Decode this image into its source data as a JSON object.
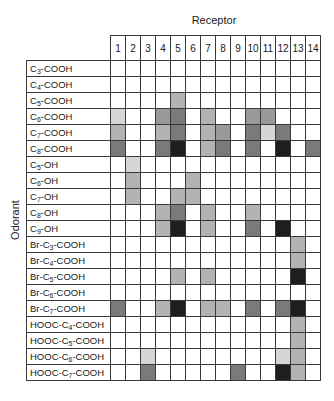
{
  "chart_data": {
    "type": "heatmap",
    "title": "Receptor",
    "xlabel": "Receptor",
    "ylabel": "Odorant",
    "legend": "none",
    "scale_note": "grayscale intensity levels 0 (white, no response) to 5 (black, strongest response)",
    "intensity_colors": [
      "#ffffff",
      "#d6d6d6",
      "#b3b3b3",
      "#999999",
      "#7a7a7a",
      "#1e1e1e"
    ],
    "columns": [
      "1",
      "2",
      "3",
      "4",
      "5",
      "6",
      "7",
      "8",
      "9",
      "10",
      "11",
      "12",
      "13",
      "14"
    ],
    "rows": [
      {
        "label": "C3-COOH",
        "prefix": "C",
        "sub": "3",
        "suffix": "-COOH"
      },
      {
        "label": "C4-COOH",
        "prefix": "C",
        "sub": "4",
        "suffix": "-COOH"
      },
      {
        "label": "C5-COOH",
        "prefix": "C",
        "sub": "5",
        "suffix": "-COOH"
      },
      {
        "label": "C6-COOH",
        "prefix": "C",
        "sub": "6",
        "suffix": "-COOH"
      },
      {
        "label": "C7-COOH",
        "prefix": "C",
        "sub": "7",
        "suffix": "-COOH"
      },
      {
        "label": "C8-COOH",
        "prefix": "C",
        "sub": "8",
        "suffix": "-COOH"
      },
      {
        "label": "C5-OH",
        "prefix": "C",
        "sub": "5",
        "suffix": "-OH"
      },
      {
        "label": "C6-OH",
        "prefix": "C",
        "sub": "6",
        "suffix": "-OH"
      },
      {
        "label": "C7-OH",
        "prefix": "C",
        "sub": "7",
        "suffix": "-OH"
      },
      {
        "label": "C8-OH",
        "prefix": "C",
        "sub": "8",
        "suffix": "-OH"
      },
      {
        "label": "C9-OH",
        "prefix": "C",
        "sub": "9",
        "suffix": "-OH"
      },
      {
        "label": "Br-C3-COOH",
        "prefix": "Br-C",
        "sub": "3",
        "suffix": "-COOH"
      },
      {
        "label": "Br-C4-COOH",
        "prefix": "Br-C",
        "sub": "4",
        "suffix": "-COOH"
      },
      {
        "label": "Br-C5-COOH",
        "prefix": "Br-C",
        "sub": "5",
        "suffix": "-COOH"
      },
      {
        "label": "Br-C6-COOH",
        "prefix": "Br-C",
        "sub": "6",
        "suffix": "-COOH"
      },
      {
        "label": "Br-C7-COOH",
        "prefix": "Br-C",
        "sub": "7",
        "suffix": "-COOH"
      },
      {
        "label": "HOOC-C4-COOH",
        "prefix": "HOOC-C",
        "sub": "4",
        "suffix": "-COOH"
      },
      {
        "label": "HOOC-C5-COOH",
        "prefix": "HOOC-C",
        "sub": "5",
        "suffix": "-COOH"
      },
      {
        "label": "HOOC-C6-COOH",
        "prefix": "HOOC-C",
        "sub": "6",
        "suffix": "-COOH"
      },
      {
        "label": "HOOC-C7-COOH",
        "prefix": "HOOC-C",
        "sub": "7",
        "suffix": "-COOH"
      }
    ],
    "values": [
      [
        0,
        0,
        0,
        0,
        0,
        0,
        0,
        0,
        0,
        0,
        0,
        0,
        0,
        0
      ],
      [
        0,
        0,
        0,
        0,
        0,
        0,
        0,
        0,
        0,
        0,
        0,
        0,
        0,
        0
      ],
      [
        0,
        0,
        0,
        0,
        2,
        0,
        0,
        0,
        0,
        0,
        0,
        0,
        0,
        0
      ],
      [
        1,
        0,
        0,
        3,
        4,
        0,
        2,
        0,
        0,
        3,
        3,
        0,
        0,
        0
      ],
      [
        2,
        0,
        0,
        2,
        4,
        0,
        2,
        3,
        0,
        4,
        1,
        4,
        0,
        0
      ],
      [
        4,
        0,
        0,
        4,
        5,
        0,
        2,
        4,
        0,
        4,
        0,
        5,
        0,
        4
      ],
      [
        0,
        1,
        0,
        0,
        0,
        0,
        0,
        0,
        0,
        0,
        0,
        0,
        0,
        0
      ],
      [
        0,
        2,
        0,
        0,
        0,
        2,
        0,
        0,
        0,
        0,
        0,
        0,
        0,
        0
      ],
      [
        0,
        2,
        0,
        0,
        2,
        2,
        0,
        0,
        0,
        0,
        0,
        0,
        0,
        0
      ],
      [
        0,
        0,
        0,
        2,
        4,
        0,
        2,
        0,
        0,
        2,
        0,
        0,
        0,
        0
      ],
      [
        0,
        0,
        0,
        2,
        5,
        0,
        2,
        0,
        0,
        4,
        0,
        5,
        0,
        0
      ],
      [
        0,
        0,
        0,
        0,
        0,
        0,
        0,
        0,
        0,
        0,
        0,
        0,
        2,
        0
      ],
      [
        0,
        0,
        0,
        0,
        0,
        0,
        0,
        0,
        0,
        0,
        0,
        0,
        2,
        0
      ],
      [
        0,
        0,
        0,
        0,
        2,
        0,
        2,
        0,
        0,
        0,
        0,
        0,
        5,
        0
      ],
      [
        0,
        0,
        0,
        0,
        0,
        0,
        0,
        0,
        0,
        0,
        0,
        0,
        0,
        0
      ],
      [
        4,
        0,
        0,
        2,
        5,
        0,
        2,
        2,
        0,
        4,
        0,
        4,
        5,
        0
      ],
      [
        0,
        0,
        0,
        0,
        0,
        0,
        0,
        0,
        0,
        0,
        0,
        0,
        2,
        0
      ],
      [
        0,
        0,
        0,
        0,
        0,
        0,
        0,
        0,
        0,
        0,
        0,
        0,
        2,
        0
      ],
      [
        0,
        0,
        1,
        0,
        0,
        0,
        0,
        0,
        0,
        0,
        0,
        1,
        2,
        0
      ],
      [
        0,
        0,
        4,
        0,
        0,
        0,
        0,
        0,
        4,
        0,
        0,
        5,
        2,
        0
      ]
    ]
  }
}
